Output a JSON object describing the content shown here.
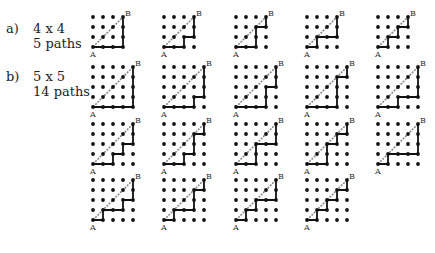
{
  "figure": {
    "parts": [
      {
        "tag": "a)",
        "size_label": "4 x 4",
        "count_label": "5 paths",
        "n": 3,
        "paths": [
          "RRRUUU",
          "RRURUU",
          "RRUURU",
          "RURRUU",
          "RURURU"
        ]
      },
      {
        "tag": "b)",
        "size_label": "5 x 5",
        "count_label": "14 paths",
        "n": 4,
        "paths": [
          "RRRRUUUU",
          "RRRURUUU",
          "RRRUURUU",
          "RRRUUURU",
          "RRURRUUU",
          "RRURURUU",
          "RRURUURU",
          "RRUURRUU",
          "RRUURURU",
          "RURRRUUU",
          "RURRURUU",
          "RURRUURU",
          "RURURRUU",
          "RURURURU"
        ]
      }
    ],
    "start_label": "A",
    "end_label": "B",
    "colors": {
      "dot": "#111111",
      "path": "#111111",
      "diagonal": "#888888"
    }
  }
}
